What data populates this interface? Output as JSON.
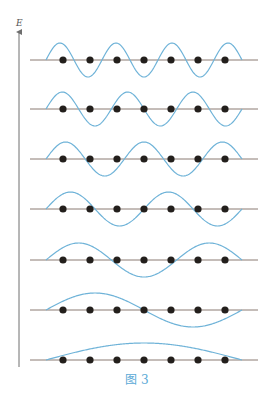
{
  "axis": {
    "label": "E"
  },
  "caption": "图 3",
  "colors": {
    "wave": "#6fb3d8",
    "line": "#8a7a72",
    "bead": "#231f1c",
    "axis": "#6e6e6e",
    "caption": "#5aa9d6"
  },
  "string": {
    "x_start": 30,
    "x_end": 258,
    "wave_x_start": 46,
    "wave_x_end": 242,
    "amplitude": 17
  },
  "beads_x": [
    63,
    90,
    117,
    144,
    171,
    198,
    225
  ],
  "modes": [
    {
      "n": 7,
      "y": 60
    },
    {
      "n": 6,
      "y": 109
    },
    {
      "n": 5,
      "y": 159
    },
    {
      "n": 4,
      "y": 209
    },
    {
      "n": 3,
      "y": 260
    },
    {
      "n": 2,
      "y": 310
    },
    {
      "n": 1,
      "y": 360
    }
  ]
}
